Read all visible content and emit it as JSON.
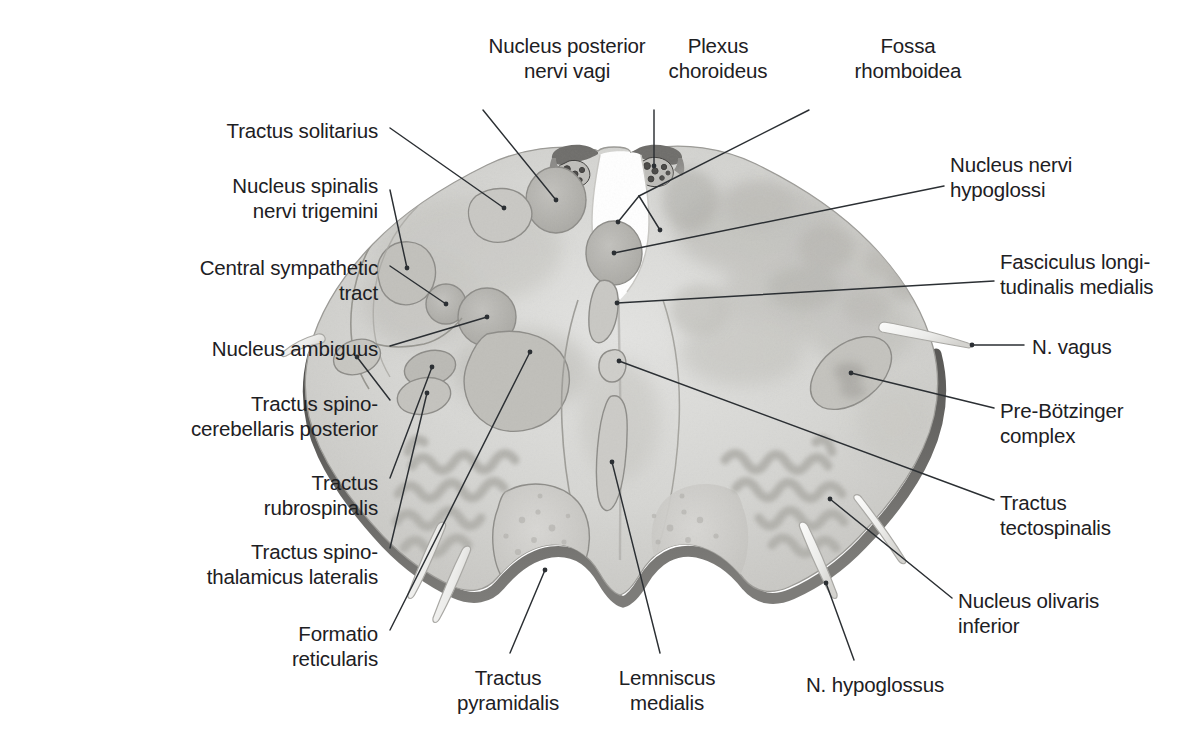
{
  "figure": {
    "orientation": "axial",
    "style": "grayscale-anatomical-illustration",
    "background_color": "#ffffff",
    "text_color": "#1d2023",
    "leader_line_color": "#2b2f33"
  },
  "palette": {
    "tissue_light": "#dcdcda",
    "tissue_mid": "#cccbc8",
    "tissue_dark": "#b9b8b4",
    "nucleus_fill": "#b4b3ae",
    "nucleus_dark": "#a5a49f",
    "outline_gray": "#8d8c88",
    "pia_dark": "#6e6d6a",
    "shadow_edge": "#575654",
    "olive_band": "#b3b2ad",
    "plexus_dark": "#4a4947",
    "nerve_white": "#f4f4f2"
  },
  "labels": [
    {
      "id": "nucleus-posterior-nervi-vagi",
      "lines": [
        "Nucleus posterior",
        "nervi vagi"
      ],
      "align": "center",
      "text_x": 477,
      "text_y": 33,
      "text_w": 180,
      "leader": [
        [
          483,
          110
        ],
        [
          556,
          200
        ]
      ],
      "dot": [
        556,
        200
      ]
    },
    {
      "id": "plexus-choroideus",
      "lines": [
        "Plexus",
        "choroideus"
      ],
      "align": "center",
      "text_x": 653,
      "text_y": 33,
      "text_w": 130,
      "leader": [
        [
          654,
          110
        ],
        [
          654,
          166
        ]
      ],
      "dot": [
        654,
        166
      ]
    },
    {
      "id": "fossa-rhomboidea",
      "lines": [
        "Fossa",
        "rhomboidea"
      ],
      "align": "center",
      "text_x": 843,
      "text_y": 33,
      "text_w": 130,
      "leader": [
        [
          809,
          110
        ],
        [
          618,
          222
        ],
        [
          660,
          230
        ]
      ],
      "dot": [
        618,
        222
      ],
      "dot2": [
        660,
        230
      ]
    },
    {
      "id": "tractus-solitarius",
      "lines": [
        "Tractus solitarius"
      ],
      "align": "right",
      "text_x": 38,
      "text_y": 118,
      "text_w": 340,
      "leader": [
        [
          390,
          128
        ],
        [
          504,
          208
        ]
      ],
      "dot": [
        504,
        208
      ]
    },
    {
      "id": "nucleus-spinalis-nervi-trigemini",
      "lines": [
        "Nucleus spinalis",
        "nervi trigemini"
      ],
      "align": "right",
      "text_x": 38,
      "text_y": 173,
      "text_w": 340,
      "leader": [
        [
          390,
          190
        ],
        [
          407,
          268
        ]
      ],
      "dot": [
        407,
        268
      ]
    },
    {
      "id": "central-sympathetic-tract",
      "lines": [
        "Central sympathetic",
        "tract"
      ],
      "align": "right",
      "text_x": 18,
      "text_y": 255,
      "text_w": 360,
      "leader": [
        [
          390,
          266
        ],
        [
          446,
          304
        ]
      ],
      "dot": [
        446,
        304
      ]
    },
    {
      "id": "nucleus-ambiguus",
      "lines": [
        "Nucleus ambiguus"
      ],
      "align": "right",
      "text_x": 38,
      "text_y": 336,
      "text_w": 340,
      "leader": [
        [
          390,
          346
        ],
        [
          487,
          317
        ]
      ],
      "dot": [
        487,
        317
      ]
    },
    {
      "id": "tractus-spinocerebellaris-posterior",
      "lines": [
        "Tractus spino-",
        "cerebellaris posterior"
      ],
      "align": "right",
      "text_x": 18,
      "text_y": 391,
      "text_w": 360,
      "leader": [
        [
          390,
          400
        ],
        [
          357,
          357
        ]
      ],
      "dot": [
        357,
        357
      ]
    },
    {
      "id": "tractus-rubrospinalis",
      "lines": [
        "Tractus",
        "rubrospinalis"
      ],
      "align": "right",
      "text_x": 38,
      "text_y": 470,
      "text_w": 340,
      "leader": [
        [
          390,
          478
        ],
        [
          432,
          367
        ]
      ],
      "dot": [
        432,
        367
      ]
    },
    {
      "id": "tractus-spinothalamicus-lateralis",
      "lines": [
        "Tractus spino-",
        "thalamicus lateralis"
      ],
      "align": "right",
      "text_x": 18,
      "text_y": 539,
      "text_w": 360,
      "leader": [
        [
          390,
          548
        ],
        [
          427,
          393
        ]
      ],
      "dot": [
        427,
        393
      ]
    },
    {
      "id": "formatio-reticularis",
      "lines": [
        "Formatio",
        "reticularis"
      ],
      "align": "right",
      "text_x": 150,
      "text_y": 621,
      "text_w": 228,
      "leader": [
        [
          390,
          630
        ],
        [
          530,
          352
        ]
      ],
      "dot": [
        530,
        352
      ]
    },
    {
      "id": "tractus-pyramidalis",
      "lines": [
        "Tractus",
        "pyramidalis"
      ],
      "align": "center",
      "text_x": 428,
      "text_y": 665,
      "text_w": 160,
      "leader": [
        [
          510,
          653
        ],
        [
          545,
          570
        ]
      ],
      "dot": [
        545,
        570
      ]
    },
    {
      "id": "lemniscus-medialis",
      "lines": [
        "Lemniscus",
        "medialis"
      ],
      "align": "center",
      "text_x": 592,
      "text_y": 665,
      "text_w": 150,
      "leader": [
        [
          660,
          653
        ],
        [
          612,
          462
        ]
      ],
      "dot": [
        612,
        462
      ]
    },
    {
      "id": "n-hypoglossus",
      "lines": [
        "N. hypoglossus"
      ],
      "align": "center",
      "text_x": 790,
      "text_y": 672,
      "text_w": 170,
      "leader": [
        [
          854,
          660
        ],
        [
          826,
          583
        ]
      ],
      "dot": [
        826,
        583
      ]
    },
    {
      "id": "nucleus-nervi-hypoglossi",
      "lines": [
        "Nucleus nervi",
        "hypoglossi"
      ],
      "align": "left",
      "text_x": 950,
      "text_y": 152,
      "text_w": 240,
      "leader": [
        [
          944,
          186
        ],
        [
          614,
          253
        ]
      ],
      "dot": [
        614,
        253
      ]
    },
    {
      "id": "fasciculus-longitudinalis-medialis",
      "lines": [
        "Fasciculus longi-",
        "tudinalis medialis"
      ],
      "align": "left",
      "text_x": 1000,
      "text_y": 249,
      "text_w": 193,
      "leader": [
        [
          994,
          281
        ],
        [
          617,
          303
        ]
      ],
      "dot": [
        617,
        303
      ]
    },
    {
      "id": "n-vagus",
      "lines": [
        "N. vagus"
      ],
      "align": "left",
      "text_x": 1032,
      "text_y": 334,
      "text_w": 160,
      "leader": [
        [
          1024,
          345
        ],
        [
          972,
          345
        ]
      ],
      "dot": [
        972,
        345
      ]
    },
    {
      "id": "pre-botzinger-complex",
      "lines": [
        "Pre-Bötzinger",
        "complex"
      ],
      "align": "left",
      "text_x": 1000,
      "text_y": 398,
      "text_w": 193,
      "leader": [
        [
          994,
          408
        ],
        [
          851,
          373
        ]
      ],
      "dot": [
        851,
        373
      ]
    },
    {
      "id": "tractus-tectospinalis",
      "lines": [
        "Tractus",
        "tectospinalis"
      ],
      "align": "left",
      "text_x": 1000,
      "text_y": 490,
      "text_w": 193,
      "leader": [
        [
          994,
          500
        ],
        [
          619,
          361
        ]
      ],
      "dot": [
        619,
        361
      ]
    },
    {
      "id": "nucleus-olivaris-inferior",
      "lines": [
        "Nucleus olivaris",
        "inferior"
      ],
      "align": "left",
      "text_x": 958,
      "text_y": 588,
      "text_w": 235,
      "leader": [
        [
          952,
          598
        ],
        [
          830,
          499
        ]
      ],
      "dot": [
        830,
        499
      ]
    }
  ],
  "structures": {
    "outline_note": "irregular butterfly-shaped medulla section with dorsal rhomboid fossa notch and two ventral pyramids",
    "bilateral_regions": [
      "nucleus posterior nervi vagi",
      "nucleus nervi hypoglossi",
      "tractus solitarius",
      "nucleus spinalis nervi trigemini",
      "central sympathetic tract",
      "nucleus ambiguus",
      "tractus spinocerebellaris posterior",
      "tractus rubrospinalis",
      "tractus spinothalamicus lateralis",
      "formatio reticularis",
      "fasciculus longitudinalis medialis",
      "tractus tectospinalis",
      "lemniscus medialis",
      "nucleus olivaris inferior",
      "tractus pyramidalis",
      "pre-Bötzinger complex"
    ],
    "nerve_roots": [
      "N. vagus",
      "N. hypoglossus"
    ],
    "choroid_plexus_tufts": 2
  }
}
